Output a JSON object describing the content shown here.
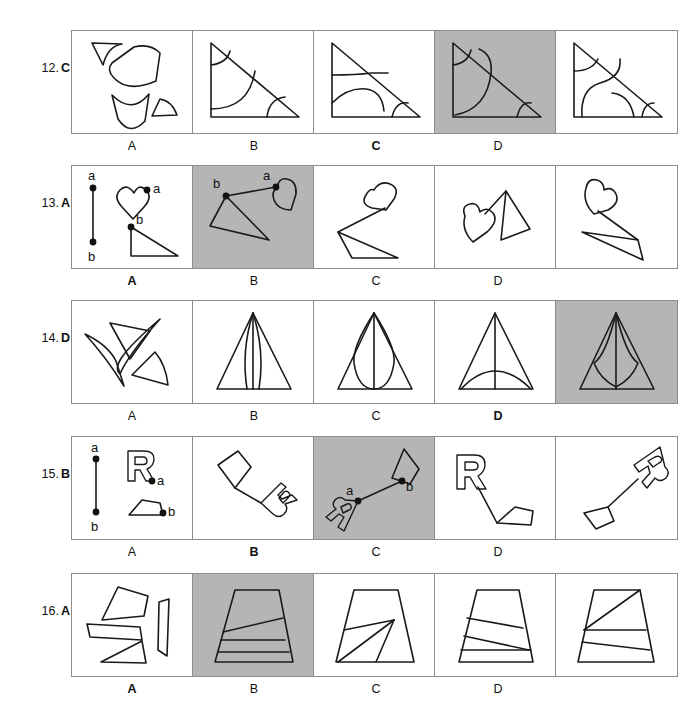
{
  "page": {
    "kind": "spatial-reasoning-worksheet",
    "background_color": "#ffffff",
    "ink_color": "#1a1a1a",
    "border_color": "#8c8c8c",
    "highlight_color": "#b5b5b5"
  },
  "option_letters": [
    "A",
    "B",
    "C",
    "D"
  ],
  "questions": [
    {
      "number": "12.",
      "answer": "C",
      "prompt_label": "",
      "type": "shape-assembly",
      "description": "Curved pieces that assemble into a right triangle with arc cuts",
      "options": [
        {
          "letter": "A",
          "correct": false
        },
        {
          "letter": "B",
          "correct": false
        },
        {
          "letter": "C",
          "correct": true
        },
        {
          "letter": "D",
          "correct": false
        }
      ]
    },
    {
      "number": "13.",
      "answer": "A",
      "type": "segment-join",
      "description": "Join heart at point a and triangle at point b along the given segment",
      "point_labels": [
        "a",
        "b"
      ],
      "options": [
        {
          "letter": "A",
          "correct": true
        },
        {
          "letter": "B",
          "correct": false
        },
        {
          "letter": "C",
          "correct": false
        },
        {
          "letter": "D",
          "correct": false
        }
      ]
    },
    {
      "number": "14.",
      "answer": "D",
      "type": "shape-assembly",
      "description": "Four slivers assemble into a narrow tall triangle with curved inner edges",
      "options": [
        {
          "letter": "A",
          "correct": false
        },
        {
          "letter": "B",
          "correct": false
        },
        {
          "letter": "C",
          "correct": false
        },
        {
          "letter": "D",
          "correct": true
        }
      ]
    },
    {
      "number": "15.",
      "answer": "B",
      "type": "segment-join",
      "description": "Join letter R at point a and pentagon at point b along the given segment",
      "point_labels": [
        "a",
        "b"
      ],
      "options": [
        {
          "letter": "A",
          "correct": false
        },
        {
          "letter": "B",
          "correct": true
        },
        {
          "letter": "C",
          "correct": false
        },
        {
          "letter": "D",
          "correct": false
        }
      ]
    },
    {
      "number": "16.",
      "answer": "A",
      "type": "shape-assembly",
      "description": "Four quadrilateral strips assemble into a trapezoid",
      "options": [
        {
          "letter": "A",
          "correct": true
        },
        {
          "letter": "B",
          "correct": false
        },
        {
          "letter": "C",
          "correct": false
        },
        {
          "letter": "D",
          "correct": false
        }
      ]
    }
  ]
}
